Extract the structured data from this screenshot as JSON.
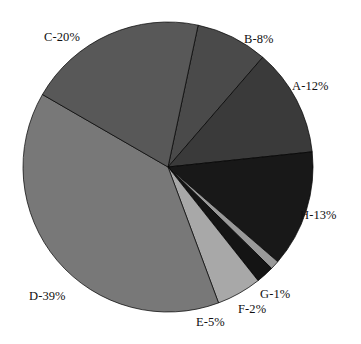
{
  "chart_data": {
    "type": "pie",
    "title": "",
    "subtitle": "",
    "xlabel": "",
    "ylabel": "",
    "legend": "none",
    "grid": false,
    "units": "percent",
    "start_angle_deg_from_12oclock": 12,
    "direction": "clockwise",
    "categories": [
      "B",
      "A",
      "H",
      "G",
      "F",
      "E",
      "D",
      "C"
    ],
    "values": [
      8,
      12,
      13,
      1,
      2,
      5,
      39,
      20
    ],
    "labels": [
      "B-8%",
      "A-12%",
      "H-13%",
      "G-1%",
      "F-2%",
      "E-5%",
      "D-39%",
      "C-20%"
    ],
    "colors": [
      "#4a4a4a",
      "#3a3a3a",
      "#181818",
      "#9a9a9a",
      "#141414",
      "#a8a8a8",
      "#787878",
      "#585858"
    ],
    "slices": [
      {
        "name": "B",
        "label": "B-8%",
        "value": 8,
        "color": "#4a4a4a",
        "label_x": 244,
        "label_y": 33
      },
      {
        "name": "A",
        "label": "A-12%",
        "value": 12,
        "color": "#3a3a3a",
        "label_x": 292,
        "label_y": 80
      },
      {
        "name": "H",
        "label": "H-13%",
        "value": 13,
        "color": "#181818",
        "label_x": 300,
        "label_y": 209
      },
      {
        "name": "G",
        "label": "G-1%",
        "value": 1,
        "color": "#9a9a9a",
        "label_x": 260,
        "label_y": 288
      },
      {
        "name": "F",
        "label": "F-2%",
        "value": 2,
        "color": "#141414",
        "label_x": 238,
        "label_y": 303
      },
      {
        "name": "E",
        "label": "E-5%",
        "value": 5,
        "color": "#a8a8a8",
        "label_x": 196,
        "label_y": 316
      },
      {
        "name": "D",
        "label": "D-39%",
        "value": 39,
        "color": "#787878",
        "label_x": 29,
        "label_y": 290
      },
      {
        "name": "C",
        "label": "C-20%",
        "value": 20,
        "color": "#585858",
        "label_x": 44,
        "label_y": 31
      }
    ],
    "geometry": {
      "cx": 168,
      "cy": 167,
      "r": 145
    }
  }
}
